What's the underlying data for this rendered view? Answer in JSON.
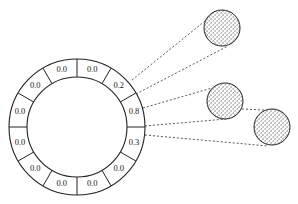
{
  "diagram": {
    "ring": {
      "center": [
        77,
        127
      ],
      "outer_radius": 68,
      "inner_radius": 50,
      "segments": [
        "0.0",
        "0.2",
        "0.8",
        "0.3",
        "0.0",
        "0.0",
        "0.0",
        "0.0",
        "0.0",
        "0.0",
        "0.0",
        "0.0"
      ]
    },
    "nodes": [
      {
        "id": "node-1",
        "center": [
          222,
          28
        ],
        "radius": 18
      },
      {
        "id": "node-2",
        "center": [
          225,
          101
        ],
        "radius": 18
      },
      {
        "id": "node-3",
        "center": [
          272,
          127
        ],
        "radius": 18
      }
    ],
    "connections": [
      {
        "from": [
          132,
          80
        ],
        "to": [
          205,
          21
        ]
      },
      {
        "from": [
          136,
          94
        ],
        "to": [
          228,
          46
        ]
      },
      {
        "from": [
          143,
          108
        ],
        "to": [
          212,
          88
        ]
      },
      {
        "from": [
          145,
          126
        ],
        "to": [
          226,
          119
        ]
      },
      {
        "from": [
          145,
          135
        ],
        "to": [
          268,
          146
        ]
      },
      {
        "from": [
          242,
          109
        ],
        "to": [
          264,
          110
        ]
      }
    ]
  }
}
